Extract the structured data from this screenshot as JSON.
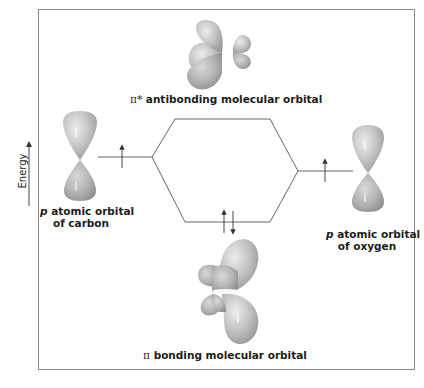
{
  "diagram": {
    "type": "molecular-orbital-energy-diagram",
    "axis": {
      "label": "Energy",
      "direction": "up"
    },
    "orbitals": {
      "antibonding": {
        "symbol": "π*",
        "label": "antibonding molecular orbital",
        "electrons": 0
      },
      "bonding": {
        "symbol": "π",
        "label": "bonding molecular orbital",
        "electrons": 2,
        "spins": [
          "up",
          "down"
        ]
      },
      "carbon_p": {
        "symbol": "p",
        "label_line1": "atomic orbital",
        "label_line2": "of carbon",
        "electrons": 1,
        "spins": [
          "up"
        ]
      },
      "oxygen_p": {
        "symbol": "p",
        "label_line1": "atomic orbital",
        "label_line2": "of oxygen",
        "electrons": 1,
        "spins": [
          "up"
        ]
      }
    },
    "colors": {
      "orbital_fill": "#c4c4c4",
      "orbital_highlight": "#e6e6e6",
      "orbital_shadow": "#9a9a9a",
      "line": "#555555",
      "frame": "#8a8a8a"
    }
  }
}
